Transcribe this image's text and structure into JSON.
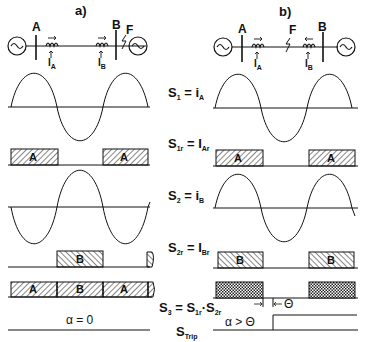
{
  "panels": [
    {
      "id": "a",
      "title": "a)",
      "network": {
        "bus_left": "A",
        "bus_right": "B",
        "fault_label": "F",
        "fault_location": "external, beyond bus B",
        "ct_left_current": "I",
        "ct_left_sub": "A",
        "ct_right_current": "I",
        "ct_right_sub": "B"
      },
      "s1r_blocks": [
        "A",
        "A"
      ],
      "s2r_blocks": [
        "B"
      ],
      "s3_blocks": [
        "A",
        "B",
        "A"
      ],
      "s3_fill": "hatched",
      "trip_label": "α = 0"
    },
    {
      "id": "b",
      "title": "b)",
      "network": {
        "bus_left": "A",
        "bus_right": "B",
        "fault_label": "F",
        "fault_location": "internal, between A and B",
        "ct_left_current": "I",
        "ct_left_sub": "A",
        "ct_right_current": "I",
        "ct_right_sub": "B"
      },
      "s1r_blocks": [
        "A",
        "A"
      ],
      "s2r_blocks": [
        "B",
        "B"
      ],
      "s3_blocks": [
        "",
        ""
      ],
      "s3_fill": "cross-hatched",
      "trip_label": "α > Θ",
      "theta_label": "Θ"
    }
  ],
  "signals": [
    {
      "name": "S",
      "sub": "1",
      "eq": "= i",
      "eq_sub": "A"
    },
    {
      "name": "S",
      "sub": "1r",
      "eq": "= I",
      "eq_sub": "Ar"
    },
    {
      "name": "S",
      "sub": "2",
      "eq": "= i",
      "eq_sub": "B"
    },
    {
      "name": "S",
      "sub": "2r",
      "eq": "= I",
      "eq_sub": "Br"
    },
    {
      "name": "S",
      "sub": "3",
      "eq": "= S",
      "eq_sub": "1r",
      "eq2": "·S",
      "eq2_sub": "2r"
    },
    {
      "name": "S",
      "sub": "Trip"
    }
  ]
}
